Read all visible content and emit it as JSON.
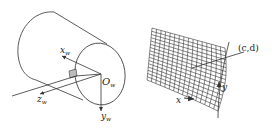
{
  "diagram": {
    "left_panel": {
      "description": "Cylinder with world coordinate frame at end-face center",
      "origin_label": {
        "main": "O",
        "sub": "w"
      },
      "axes": [
        {
          "name": "x",
          "main": "x",
          "sub": "w",
          "direction": "up-left"
        },
        {
          "name": "z",
          "main": "z",
          "sub": "w",
          "direction": "down-left"
        },
        {
          "name": "y",
          "main": "y",
          "sub": "w",
          "direction": "down"
        }
      ],
      "patch": "small shaded rectangle on cylinder surface"
    },
    "right_panel": {
      "description": "Curved grid mesh (unrolled surface patch) with pointer to point",
      "point_label": "(c,d)",
      "axes": [
        {
          "name": "x",
          "label": "x",
          "direction": "right"
        },
        {
          "name": "y",
          "label": "y",
          "direction": "up"
        }
      ],
      "grid": {
        "rows": 16,
        "cols": 16
      }
    },
    "colors": {
      "line": "#333333",
      "patch": "#bbbbbb",
      "background": "#ffffff"
    }
  }
}
